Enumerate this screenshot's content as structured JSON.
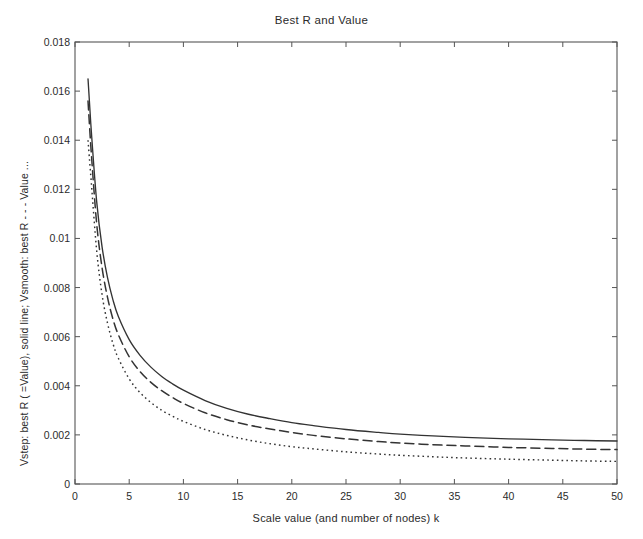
{
  "chart_data": {
    "type": "line",
    "title": "Best R and Value",
    "xlabel": "Scale value (and number of nodes) k",
    "ylabel": "Vstep: best R ( =Value), solid line; Vsmooth: best R - - - Value ...",
    "xlim": [
      0,
      50
    ],
    "ylim": [
      0,
      0.018
    ],
    "xticks": [
      0,
      5,
      10,
      15,
      20,
      25,
      30,
      35,
      40,
      45,
      50
    ],
    "xtick_labels": [
      "0",
      "5",
      "10",
      "15",
      "20",
      "25",
      "30",
      "35",
      "40",
      "45",
      "50"
    ],
    "yticks": [
      0,
      0.002,
      0.004,
      0.006,
      0.008,
      0.01,
      0.012,
      0.014,
      0.016,
      0.018
    ],
    "ytick_labels": [
      "0",
      "0.002",
      "0.004",
      "0.006",
      "0.008",
      "0.01",
      "0.012",
      "0.014",
      "0.016",
      "0.018"
    ],
    "grid": false,
    "legend_position": "none",
    "line_color": "#333333",
    "axis_color": "#555555",
    "x": [
      1.2,
      1.5,
      2,
      2.5,
      3,
      3.5,
      4,
      5,
      6,
      7,
      8,
      9,
      10,
      12,
      14,
      16,
      18,
      20,
      22,
      25,
      28,
      30,
      33,
      36,
      40,
      44,
      47,
      50
    ],
    "series": [
      {
        "name": "Vstep: best R ( = Value)",
        "style": "solid",
        "values": [
          0.0165,
          0.0144,
          0.0115,
          0.00965,
          0.0084,
          0.0075,
          0.00682,
          0.00588,
          0.00524,
          0.00476,
          0.00438,
          0.00408,
          0.00382,
          0.0034,
          0.00308,
          0.00284,
          0.00266,
          0.0025,
          0.00238,
          0.00222,
          0.0021,
          0.00203,
          0.00196,
          0.0019,
          0.00184,
          0.0018,
          0.00177,
          0.00175
        ]
      },
      {
        "name": "Vsmooth: best R",
        "style": "dashed",
        "values": [
          0.0156,
          0.0135,
          0.0106,
          0.0088,
          0.0076,
          0.00672,
          0.00608,
          0.00518,
          0.00458,
          0.00414,
          0.0038,
          0.00352,
          0.00328,
          0.0029,
          0.00262,
          0.0024,
          0.00224,
          0.0021,
          0.00198,
          0.00184,
          0.00173,
          0.00167,
          0.0016,
          0.00155,
          0.00149,
          0.00145,
          0.00142,
          0.0014
        ]
      },
      {
        "name": "Vsmooth: Value",
        "style": "dotted",
        "values": [
          0.014,
          0.0123,
          0.0095,
          0.0077,
          0.00655,
          0.00572,
          0.00512,
          0.00428,
          0.00372,
          0.00332,
          0.003,
          0.00276,
          0.00255,
          0.00222,
          0.00198,
          0.00179,
          0.00164,
          0.00152,
          0.00143,
          0.00131,
          0.00122,
          0.00117,
          0.00111,
          0.00106,
          0.00101,
          0.00097,
          0.00094,
          0.00092
        ]
      }
    ]
  }
}
